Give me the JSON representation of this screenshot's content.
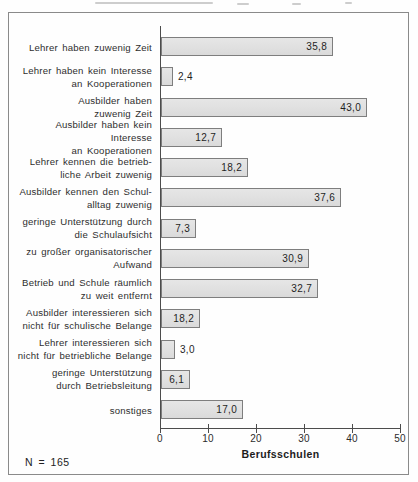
{
  "scan_artifacts": [
    "caption-remnant-strokes-top"
  ],
  "frame": {
    "border_color": "#8a8a8a",
    "background": "#fefefe"
  },
  "chart_data": {
    "type": "bar",
    "orientation": "horizontal",
    "title": "",
    "xlabel": "Berufsschulen",
    "note": "N = 165",
    "xlim": [
      0,
      50
    ],
    "x_ticks": [
      0,
      10,
      20,
      30,
      40,
      50
    ],
    "grid": false,
    "bar_fill": "#e2e2e2",
    "bar_border": "#7e7e7e",
    "axis_color": "#4c4c4c",
    "rows": [
      {
        "label_lines": [
          "Lehrer haben zuwenig Zeit"
        ],
        "value": 35.8,
        "value_label": "35,8",
        "drawn_value": 35.8,
        "label_placement": "inside"
      },
      {
        "label_lines": [
          "Lehrer haben kein Interesse",
          "an Kooperationen"
        ],
        "value": 2.4,
        "value_label": "2,4",
        "drawn_value": 2.4,
        "label_placement": "outside"
      },
      {
        "label_lines": [
          "Ausbilder haben",
          "zuwenig Zeit"
        ],
        "value": 43.0,
        "value_label": "43,0",
        "drawn_value": 43.0,
        "label_placement": "inside"
      },
      {
        "label_lines": [
          "Ausbilder haben kein Interesse",
          "an Kooperationen"
        ],
        "value": 12.7,
        "value_label": "12,7",
        "drawn_value": 12.7,
        "label_placement": "inside"
      },
      {
        "label_lines": [
          "Lehrer kennen die betrieb-",
          "liche Arbeit zuwenig"
        ],
        "value": 18.2,
        "value_label": "18,2",
        "drawn_value": 18.2,
        "label_placement": "inside"
      },
      {
        "label_lines": [
          "Ausbilder kennen den Schul-",
          "alltag zuwenig"
        ],
        "value": 37.6,
        "value_label": "37,6",
        "drawn_value": 37.6,
        "label_placement": "inside"
      },
      {
        "label_lines": [
          "geringe Unterstützung durch",
          "die Schulaufsicht"
        ],
        "value": 7.3,
        "value_label": "7,3",
        "drawn_value": 7.3,
        "label_placement": "inside"
      },
      {
        "label_lines": [
          "zu großer organisatorischer",
          "Aufwand"
        ],
        "value": 30.9,
        "value_label": "30,9",
        "drawn_value": 30.9,
        "label_placement": "inside"
      },
      {
        "label_lines": [
          "Betrieb und Schule räumlich",
          "zu weit entfernt"
        ],
        "value": 32.7,
        "value_label": "32,7",
        "drawn_value": 32.7,
        "label_placement": "inside"
      },
      {
        "label_lines": [
          "Ausbilder interessieren sich",
          "nicht für schulische Belange"
        ],
        "value": 18.2,
        "value_label": "18,2",
        "drawn_value": 8.2,
        "label_placement": "inside"
      },
      {
        "label_lines": [
          "Lehrer interessieren sich",
          "nicht für betriebliche Belange"
        ],
        "value": 3.0,
        "value_label": "3,0",
        "drawn_value": 3.0,
        "label_placement": "outside"
      },
      {
        "label_lines": [
          "geringe Unterstützung",
          "durch Betriebsleitung"
        ],
        "value": 6.1,
        "value_label": "6,1",
        "drawn_value": 6.1,
        "label_placement": "inside"
      },
      {
        "label_lines": [
          "sonstiges"
        ],
        "value": 17.0,
        "value_label": "17,0",
        "drawn_value": 17.0,
        "label_placement": "inside"
      }
    ]
  }
}
